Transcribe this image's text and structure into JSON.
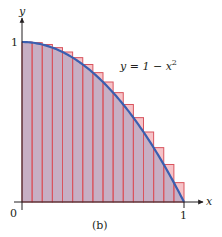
{
  "chart_data": {
    "type": "bar",
    "subtype": "riemann-upper-sum",
    "title": "",
    "caption": "(b)",
    "xlabel": "x",
    "ylabel": "y",
    "xlim": [
      0,
      1
    ],
    "ylim": [
      0,
      1
    ],
    "x_ticks": [
      {
        "value": 0,
        "label": "0"
      },
      {
        "value": 1,
        "label": "1"
      }
    ],
    "y_ticks": [
      {
        "value": 1,
        "label": "1"
      }
    ],
    "grid": false,
    "legend": null,
    "curve": {
      "label": "y = 1 − x²",
      "label_main": "y = 1 − x",
      "label_sup": "2",
      "function": "1 - x^2",
      "color": "#3a5fb0"
    },
    "n_rectangles": 16,
    "bar_width": 0.0625,
    "categories": [
      "0",
      "0.0625",
      "0.125",
      "0.1875",
      "0.25",
      "0.3125",
      "0.375",
      "0.4375",
      "0.5",
      "0.5625",
      "0.625",
      "0.6875",
      "0.75",
      "0.8125",
      "0.875",
      "0.9375"
    ],
    "values": [
      1.0,
      0.9961,
      0.9844,
      0.9648,
      0.9375,
      0.9023,
      0.8594,
      0.8086,
      0.75,
      0.6836,
      0.6094,
      0.5273,
      0.4375,
      0.3398,
      0.2344,
      0.1211
    ],
    "colors": {
      "bar_fill_under": "#c7afc4",
      "bar_fill_above": "#f6c3c8",
      "bar_edge": "#d9545e",
      "curve": "#3a5fb0",
      "axis": "#231f20"
    }
  }
}
